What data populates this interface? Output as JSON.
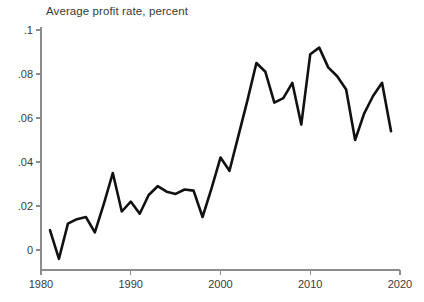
{
  "chart_data": {
    "type": "line",
    "title": "Average profit rate, percent",
    "xlabel": "",
    "ylabel": "",
    "xlim": [
      1980,
      2020
    ],
    "ylim": [
      -0.008,
      0.1
    ],
    "grid": false,
    "legend": null,
    "xticks": [
      1980,
      1990,
      2000,
      2010,
      2020
    ],
    "xtick_labels": [
      "1980",
      "1990",
      "2000",
      "2010",
      "2020"
    ],
    "yticks": [
      0,
      0.02,
      0.04,
      0.06,
      0.08,
      0.1
    ],
    "ytick_labels": [
      "0",
      ".02",
      ".04",
      ".06",
      ".08",
      ".1"
    ],
    "line_color": "#111111",
    "axis_color": "#8d8d8d",
    "background_color": "#ffffff",
    "x": [
      1981,
      1982,
      1983,
      1984,
      1985,
      1986,
      1987,
      1988,
      1989,
      1990,
      1991,
      1992,
      1993,
      1994,
      1995,
      1996,
      1997,
      1998,
      1999,
      2000,
      2001,
      2002,
      2003,
      2004,
      2005,
      2006,
      2007,
      2008,
      2009,
      2010,
      2011,
      2012,
      2013,
      2014,
      2015,
      2016,
      2017,
      2018,
      2019
    ],
    "values": [
      0.009,
      -0.004,
      0.012,
      0.014,
      0.015,
      0.008,
      0.021,
      0.035,
      0.0175,
      0.022,
      0.0165,
      0.025,
      0.029,
      0.0265,
      0.0255,
      0.0275,
      0.027,
      0.015,
      0.028,
      0.042,
      0.036,
      0.052,
      0.068,
      0.085,
      0.081,
      0.067,
      0.069,
      0.076,
      0.057,
      0.089,
      0.092,
      0.083,
      0.079,
      0.073,
      0.05,
      0.062,
      0.07,
      0.076,
      0.054
    ],
    "series_name": "Average profit rate"
  }
}
